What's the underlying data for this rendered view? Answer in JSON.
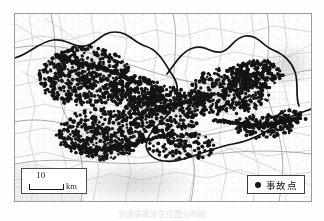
{
  "figure": {
    "type": "thematic-point-density-map",
    "caption": "交通事故发生位置分布图"
  },
  "map": {
    "background_color": "#fdfdfd",
    "frame_color": "#9a9a9a",
    "road_color": "#b5b5b5",
    "boundary_color": "#141414",
    "point_color": "#141414",
    "urban_shade_color": "#d9d9d9"
  },
  "scale_bar": {
    "name": "scale-bar",
    "number": "10",
    "unit": "km"
  },
  "legend": {
    "name": "legend",
    "items": [
      {
        "symbol": "filled-circle",
        "label": "事故点",
        "color": "#141414"
      }
    ]
  },
  "map_data": {
    "type": "point-density",
    "symbol": "filled-circle",
    "point_radius_px": 1.6,
    "clusters": [
      {
        "name": "west-urban-core",
        "cx": 70,
        "cy": 62,
        "rx": 46,
        "ry": 30,
        "count": 520,
        "density": "very-high"
      },
      {
        "name": "west-south-corridor",
        "cx": 86,
        "cy": 120,
        "rx": 44,
        "ry": 26,
        "count": 430,
        "density": "very-high"
      },
      {
        "name": "central-corridor",
        "cx": 150,
        "cy": 96,
        "rx": 40,
        "ry": 24,
        "count": 360,
        "density": "high"
      },
      {
        "name": "central-ridge",
        "cx": 118,
        "cy": 78,
        "rx": 32,
        "ry": 16,
        "count": 210,
        "density": "high"
      },
      {
        "name": "east-urban-core",
        "cx": 214,
        "cy": 78,
        "rx": 40,
        "ry": 24,
        "count": 400,
        "density": "very-high"
      },
      {
        "name": "east-northeast-arm",
        "cx": 242,
        "cy": 60,
        "rx": 26,
        "ry": 14,
        "count": 180,
        "density": "high"
      },
      {
        "name": "southeast-coastal",
        "cx": 248,
        "cy": 112,
        "rx": 30,
        "ry": 12,
        "count": 150,
        "density": "medium"
      },
      {
        "name": "south-scatter",
        "cx": 168,
        "cy": 132,
        "rx": 34,
        "ry": 14,
        "count": 120,
        "density": "medium"
      },
      {
        "name": "far-east-tail",
        "cx": 276,
        "cy": 104,
        "rx": 16,
        "ry": 8,
        "count": 55,
        "density": "low"
      }
    ],
    "trails": [
      {
        "name": "northwest-road-trail",
        "path": [
          [
            40,
            40
          ],
          [
            58,
            48
          ],
          [
            80,
            52
          ],
          [
            104,
            60
          ],
          [
            126,
            70
          ]
        ]
      },
      {
        "name": "south-road-trail",
        "path": [
          [
            52,
            132
          ],
          [
            78,
            136
          ],
          [
            106,
            134
          ],
          [
            132,
            126
          ],
          [
            158,
            120
          ]
        ]
      },
      {
        "name": "east-coastal-trail",
        "path": [
          [
            200,
            106
          ],
          [
            224,
            110
          ],
          [
            248,
            112
          ],
          [
            268,
            108
          ],
          [
            286,
            104
          ]
        ]
      },
      {
        "name": "central-link-trail",
        "path": [
          [
            132,
            96
          ],
          [
            154,
            92
          ],
          [
            176,
            86
          ],
          [
            198,
            80
          ]
        ]
      }
    ]
  }
}
